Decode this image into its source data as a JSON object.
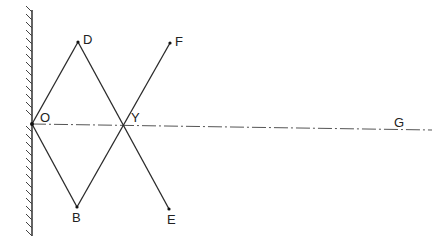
{
  "diagram": {
    "type": "ray-reflection",
    "colors": {
      "ink": "#2a2a2a",
      "axis": "#555555",
      "background": "#ffffff"
    },
    "points": {
      "O": {
        "label": "O",
        "x": 32,
        "y": 124
      },
      "D": {
        "label": "D",
        "x": 78,
        "y": 42
      },
      "Y": {
        "label": "Y",
        "x": 123,
        "y": 124
      },
      "F": {
        "label": "F",
        "x": 170,
        "y": 43
      },
      "B": {
        "label": "B",
        "x": 77,
        "y": 207
      },
      "E": {
        "label": "E",
        "x": 169,
        "y": 209
      },
      "G": {
        "label": "G"
      }
    },
    "segments": [
      "O-D",
      "D-E",
      "O-B",
      "B-F"
    ],
    "axis": {
      "from": "O",
      "to": "G",
      "style": "dash-dot"
    },
    "mirror": {
      "x": 32,
      "y_top": 10,
      "y_bottom": 236,
      "hatch_side": "left"
    }
  }
}
